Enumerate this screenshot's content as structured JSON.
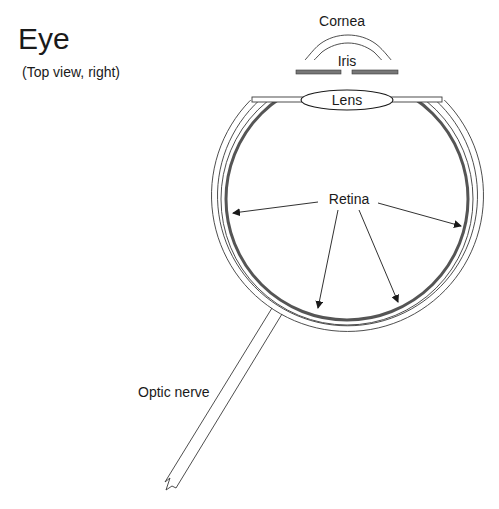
{
  "title": "Eye",
  "subtitle": "(Top view, right)",
  "labels": {
    "cornea": "Cornea",
    "iris": "Iris",
    "lens": "Lens",
    "retina": "Retina",
    "optic_nerve": "Optic nerve"
  },
  "colors": {
    "line": "#3a3a3a",
    "retina": "#555555",
    "background": "#ffffff"
  }
}
